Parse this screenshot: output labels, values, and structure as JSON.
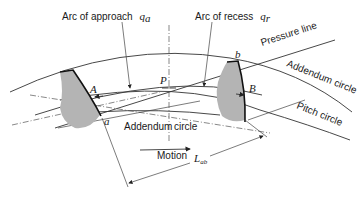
{
  "figure": {
    "labels": {
      "arc_approach": "Arc of approach",
      "arc_approach_symbol": "q",
      "arc_approach_sub": "a",
      "arc_recess": "Arc of recess",
      "arc_recess_symbol": "q",
      "arc_recess_sub": "r",
      "pressure_line": "Pressure line",
      "addendum_circle_right": "Addendum circle",
      "addendum_circle_center_left": "Addendum",
      "addendum_circle_center_right": "circle",
      "pitch_circle": "Pitch circle",
      "motion": "Motion",
      "length_of_action": "L",
      "length_of_action_sub": "ab",
      "point_A": "A",
      "point_a": "a",
      "point_P": "P",
      "point_b": "b",
      "point_B": "B"
    },
    "colors": {
      "tooth_fill": "#b4b4b4",
      "line": "#333333",
      "background": "#ffffff"
    }
  }
}
